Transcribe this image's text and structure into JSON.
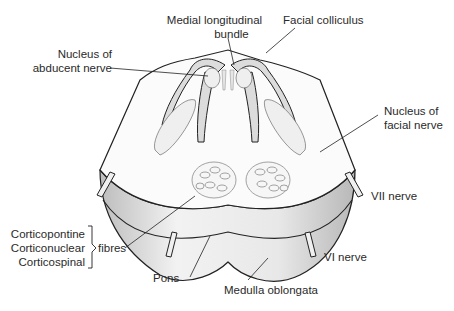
{
  "labels": {
    "medial_longitudinal_bundle": [
      "Medial longitudinal",
      "bundle"
    ],
    "facial_colliculus": "Facial colliculus",
    "nucleus_abducent": [
      "Nucleus of",
      "abducent nerve"
    ],
    "nucleus_facial": [
      "Nucleus of",
      "facial nerve"
    ],
    "vii_nerve": "VII nerve",
    "vi_nerve": "VI nerve",
    "fibres_group": [
      "Corticopontine",
      "Corticonuclear",
      "Corticospinal"
    ],
    "fibres": "fibres",
    "pons": "Pons",
    "medulla": "Medulla oblongata"
  },
  "colors": {
    "outline": "#222222",
    "shade": "#d8d8d8",
    "light_shade": "#ececec",
    "text": "#2a2a2a"
  }
}
